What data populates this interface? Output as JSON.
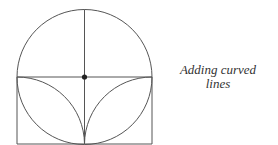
{
  "diagram": {
    "caption_lines": [
      "Adding curved",
      "lines"
    ],
    "colors": {
      "line": "#555555",
      "dot": "#222222",
      "text": "#333333",
      "background": "#ffffff"
    },
    "elements": [
      "circle",
      "vertical-diameter",
      "horizontal-diameter",
      "center-dot",
      "lower-box",
      "left-inner-arc",
      "right-inner-arc"
    ]
  }
}
